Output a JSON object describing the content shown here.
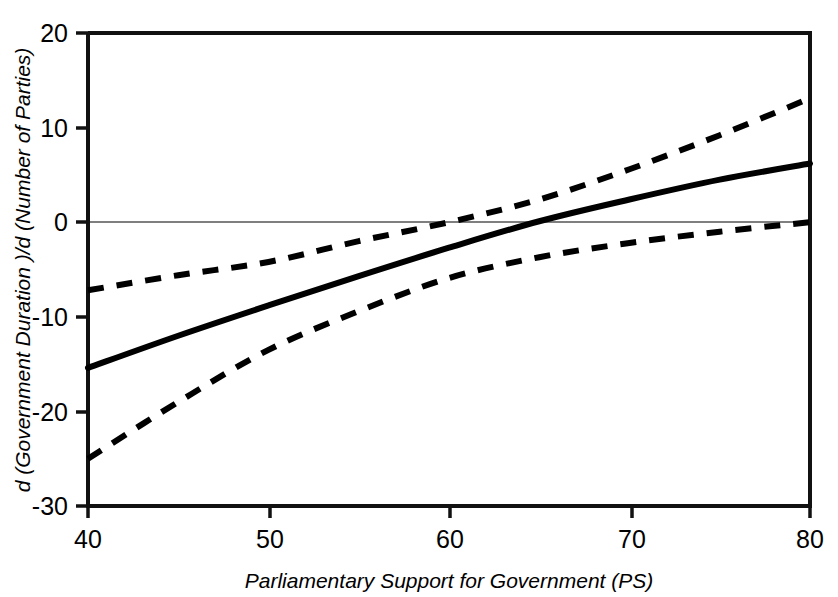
{
  "chart_data": {
    "type": "line",
    "title": "",
    "xlabel": "Parliamentary Support for Government (PS)",
    "ylabel": "d (Government Duration )/d (Number of Parties)",
    "xlim": [
      40,
      80
    ],
    "ylim": [
      -30,
      20
    ],
    "xticks": [
      40,
      50,
      60,
      70,
      80
    ],
    "yticks": [
      20,
      10,
      0,
      -10,
      -20,
      -30
    ],
    "xtick_labels": [
      "40",
      "50",
      "60",
      "70",
      "80"
    ],
    "ytick_labels": [
      "20",
      "10",
      "0",
      "-10",
      "-20",
      "-30"
    ],
    "grid": false,
    "legend": "none",
    "zero_reference_line": 0,
    "x": [
      40,
      45,
      50,
      55,
      60,
      65,
      70,
      75,
      80
    ],
    "series": [
      {
        "name": "Upper 95% confidence bound",
        "style": "dashed",
        "values": [
          -7.2,
          -5.6,
          -4.2,
          -2.0,
          0.0,
          2.4,
          5.6,
          9.2,
          13.1
        ]
      },
      {
        "name": "Marginal effect estimate",
        "style": "solid",
        "values": [
          -15.4,
          -12.0,
          -8.8,
          -5.7,
          -2.7,
          0.1,
          2.4,
          4.5,
          6.2
        ]
      },
      {
        "name": "Lower 95% confidence bound",
        "style": "dashed",
        "values": [
          -25.0,
          -19.0,
          -13.5,
          -9.4,
          -5.9,
          -3.7,
          -2.2,
          -1.0,
          0.0
        ]
      }
    ],
    "zero_crossings": {
      "upper_bound_at_ps": 60.3,
      "estimate_at_ps": 66.4,
      "lower_bound_at_ps": 80.0
    },
    "colors": {
      "axis": "#000000",
      "estimate": "#000000",
      "bounds": "#000000",
      "zero_line": "#555555",
      "background": "#ffffff"
    }
  }
}
